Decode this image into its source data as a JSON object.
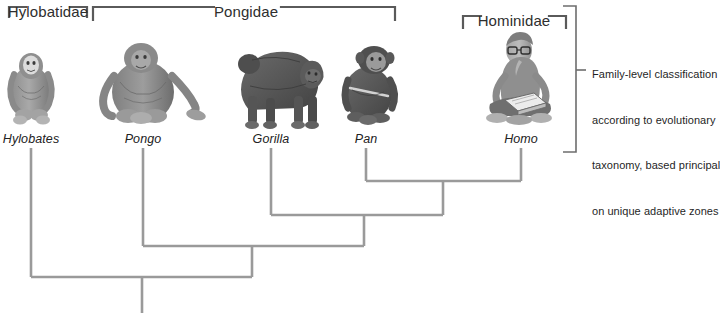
{
  "figure": {
    "title_hidden": "",
    "background_color": "#ffffff",
    "line_color": "#9a9a9a",
    "bracket_color": "#5a5a5a",
    "width": 720,
    "height": 315
  },
  "brackets": [
    {
      "label": "Hylobatidae",
      "left": 8,
      "right": 88,
      "label_x": 48,
      "label_y": 11
    },
    {
      "label": "Pongidae",
      "left": 92,
      "right": 396,
      "label_x": 246,
      "label_y": 11
    },
    {
      "label": "Hominidae",
      "left": 462,
      "right": 566,
      "label_x": 514,
      "label_y": 18
    }
  ],
  "taxa": [
    {
      "genus": "Hylobates",
      "label_x": 31,
      "label_y": 139,
      "tip_x": 31,
      "icon": "gibbon-illustration"
    },
    {
      "genus": "Pongo",
      "label_x": 143,
      "label_y": 139,
      "tip_x": 143,
      "icon": "orangutan-illustration"
    },
    {
      "genus": "Gorilla",
      "label_x": 271,
      "label_y": 139,
      "tip_x": 271,
      "icon": "gorilla-illustration"
    },
    {
      "genus": "Pan",
      "label_x": 366,
      "label_y": 139,
      "tip_x": 366,
      "icon": "chimpanzee-illustration"
    },
    {
      "genus": "Homo",
      "label_x": 521,
      "label_y": 139,
      "tip_x": 521,
      "icon": "human-illustration"
    }
  ],
  "cladogram": {
    "tip_top_y": 148,
    "nodes": [
      {
        "name": "pan-homo-node",
        "left_x": 366,
        "right_x": 521,
        "y": 181,
        "stem_x": 443,
        "stem_bottom_y": 215
      },
      {
        "name": "gorilla-node",
        "left_x": 271,
        "right_x": 443,
        "y": 215,
        "stem_x": 364,
        "stem_bottom_y": 246
      },
      {
        "name": "pongo-node",
        "left_x": 143,
        "right_x": 364,
        "y": 246,
        "stem_x": 252,
        "stem_bottom_y": 277
      },
      {
        "name": "root-node",
        "left_x": 31,
        "right_x": 252,
        "y": 277,
        "stem_x": 142,
        "stem_bottom_y": 313
      }
    ]
  },
  "annotation": {
    "bracket": {
      "x": 576,
      "top_y": 5,
      "bottom_y": 152,
      "tick_y": 70,
      "tick_x_end": 584
    },
    "lines": [
      "Family-level classification",
      "according to evolutionary",
      "taxonomy, based principally",
      "on unique adaptive zones"
    ],
    "text_x": 592,
    "text_y": 40
  }
}
